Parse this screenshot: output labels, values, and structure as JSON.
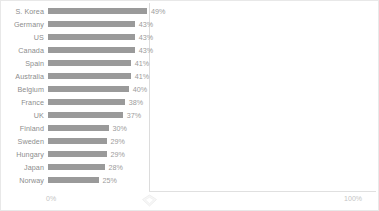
{
  "chart_data": {
    "type": "bar",
    "orientation": "horizontal",
    "title": "",
    "subtitle": "",
    "xlabel": "",
    "ylabel": "",
    "xlim": [
      0,
      100
    ],
    "grid": true,
    "gridlines_at": [
      50
    ],
    "legend": "none",
    "value_suffix": "%",
    "categories": [
      "S. Korea",
      "Germany",
      "US",
      "Canada",
      "Spain",
      "Australia",
      "Belgium",
      "France",
      "UK",
      "Finland",
      "Sweden",
      "Hungary",
      "Japan",
      "Norway"
    ],
    "values": [
      49,
      43,
      43,
      43,
      41,
      41,
      40,
      38,
      37,
      30,
      29,
      29,
      28,
      25
    ],
    "data_labels": [
      "49%",
      "43%",
      "43%",
      "43%",
      "41%",
      "41%",
      "40%",
      "38%",
      "37%",
      "30%",
      "29%",
      "29%",
      "28%",
      "25%"
    ],
    "tick_labels": {
      "min": "0%",
      "max": "100%"
    },
    "colors": {
      "bar": "#9a9a9a",
      "category_label": "#8d8d8d",
      "value_label": "#9b9b9b",
      "tick_label": "#c4c4c4",
      "gridline": "#dcdcdc",
      "axis_line": "#e0e0e0",
      "background": "#ffffff",
      "border": "#e8e8e8"
    }
  },
  "markers": {
    "midpoint_marker": "diamond-marker"
  }
}
